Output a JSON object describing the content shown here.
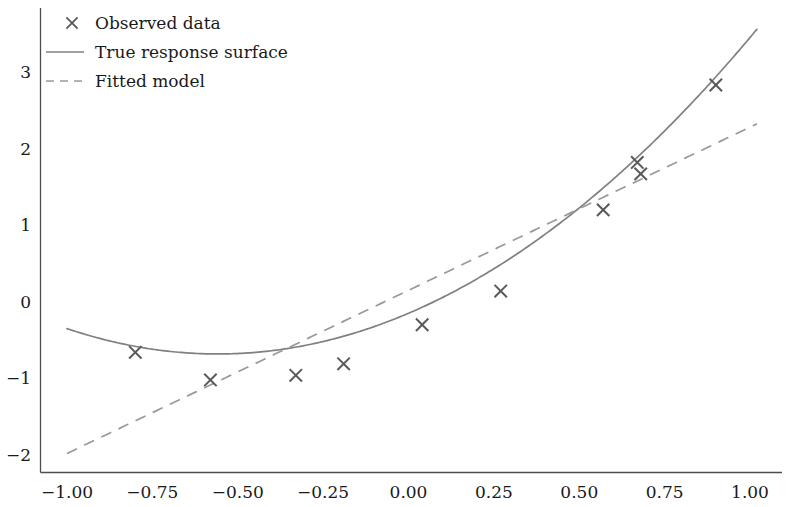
{
  "chart_data": {
    "type": "scatter",
    "title": "",
    "subtitle": "",
    "xlabel": "",
    "ylabel": "",
    "xlim": [
      -1.09,
      1.06
    ],
    "ylim": [
      -2.28,
      3.62
    ],
    "grid": false,
    "legend_position": "upper left",
    "xticks": [
      -1.0,
      -0.75,
      -0.5,
      -0.25,
      0.0,
      0.25,
      0.5,
      0.75,
      1.0
    ],
    "xtick_labels": [
      "−1.00",
      "−0.75",
      "−0.50",
      "−0.25",
      "0.00",
      "0.25",
      "0.50",
      "0.75",
      "1.00"
    ],
    "yticks": [
      3,
      2,
      1,
      0,
      -1,
      -2
    ],
    "ytick_labels": [
      "3",
      "2",
      "1",
      "0",
      "−1",
      "−2"
    ],
    "series": [
      {
        "name": "Observed data",
        "type": "scatter",
        "marker": "x",
        "color": "#595959",
        "x": [
          -0.8,
          -0.58,
          -0.33,
          -0.19,
          0.04,
          0.27,
          0.57,
          0.67,
          0.68,
          0.9
        ],
        "y": [
          -0.66,
          -1.02,
          -0.96,
          -0.81,
          -0.3,
          0.14,
          1.2,
          1.82,
          1.67,
          2.83
        ]
      },
      {
        "name": "True response surface",
        "type": "line",
        "style": "solid",
        "color": "#808080",
        "model": "quadratic",
        "coefficients": {
          "a": 1.7,
          "b": 1.9,
          "c": -0.15
        },
        "x_range": [
          -1.0,
          1.02
        ]
      },
      {
        "name": "Fitted model",
        "type": "line",
        "style": "dashed",
        "color": "#999999",
        "model": "linear",
        "coefficients": {
          "slope": 2.13,
          "intercept": 0.15
        },
        "x_range": [
          -1.0,
          1.02
        ]
      }
    ],
    "legend_entries": [
      {
        "label": "Observed data",
        "glyph": "x-marker",
        "color": "#595959"
      },
      {
        "label": "True response surface",
        "glyph": "solid-line",
        "color": "#808080"
      },
      {
        "label": "Fitted model",
        "glyph": "dashed-line",
        "color": "#999999"
      }
    ],
    "colors": {
      "background": "#ffffff",
      "axis": "#4d4d4d",
      "text": "#1a1a1a",
      "marker": "#595959",
      "true_curve": "#808080",
      "fitted_line": "#999999"
    }
  }
}
